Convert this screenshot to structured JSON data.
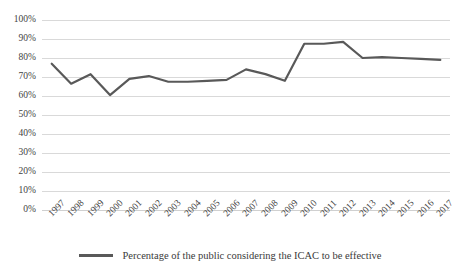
{
  "chart_data": {
    "type": "line",
    "title": "",
    "subtitle": "",
    "xlabel": "",
    "ylabel": "",
    "ylim": [
      0,
      100
    ],
    "ytick_labels": [
      "100%",
      "90%",
      "80%",
      "70%",
      "60%",
      "50%",
      "40%",
      "30%",
      "20%",
      "10%",
      "0%"
    ],
    "ytick_values": [
      100,
      90,
      80,
      70,
      60,
      50,
      40,
      30,
      20,
      10,
      0
    ],
    "grid": true,
    "legend_position": "bottom-center",
    "categories": [
      "1997",
      "1998",
      "1999",
      "2000",
      "2001",
      "2002",
      "2003",
      "2004",
      "2005",
      "2006",
      "2007",
      "2008",
      "2009",
      "2010",
      "2011",
      "2012",
      "2013",
      "2014",
      "2015",
      "2016",
      "2017"
    ],
    "series": [
      {
        "name": "Percentage of the public considering the ICAC to be effective",
        "color": "#595959",
        "values": [
          77,
          66.5,
          71.5,
          60.5,
          69,
          70.5,
          67.5,
          67.5,
          68,
          68.5,
          74,
          71.5,
          68,
          87.5,
          87.5,
          88.5,
          80,
          80.5,
          80,
          79.5,
          79
        ]
      }
    ],
    "annotations": []
  },
  "legend": {
    "swatch_name": "line-swatch",
    "label": "Percentage of the public considering the ICAC to be effective"
  },
  "colors": {
    "line": "#595959",
    "gridline": "#d9d9d9",
    "axis_text": "#3f3f3f",
    "background": "#ffffff"
  }
}
